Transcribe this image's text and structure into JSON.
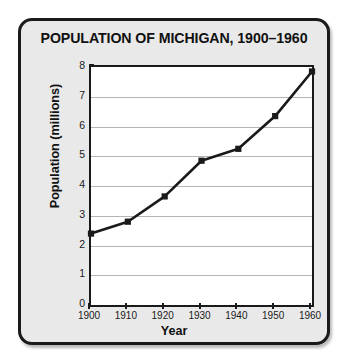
{
  "chart_data": {
    "type": "line",
    "title": "POPULATION OF MICHIGAN, 1900–1960",
    "xlabel": "Year",
    "ylabel": "Population (millions)",
    "x": [
      1900,
      1910,
      1920,
      1930,
      1940,
      1950,
      1960
    ],
    "values": [
      2.4,
      2.8,
      3.65,
      4.85,
      5.25,
      6.35,
      7.85
    ],
    "series": [
      {
        "name": "Population (millions)",
        "values": [
          2.4,
          2.8,
          3.65,
          4.85,
          5.25,
          6.35,
          7.85
        ]
      }
    ],
    "xtick_labels": [
      "1900",
      "1910",
      "1920",
      "1930",
      "1940",
      "1950",
      "1960"
    ],
    "ytick_labels": [
      "0",
      "1",
      "2",
      "3",
      "4",
      "5",
      "6",
      "7",
      "8"
    ],
    "ytick_values": [
      0,
      1,
      2,
      3,
      4,
      5,
      6,
      7,
      8
    ],
    "xlim": [
      1900,
      1960
    ],
    "ylim": [
      0,
      8
    ],
    "grid": "horizontal",
    "legend": "none",
    "marker": "square",
    "line_color": "#1a1a1a",
    "marker_color": "#1a1a1a",
    "grid_color": "#b4b4b4",
    "plot_background": "#ffffff",
    "card_background": "#e9e9e9",
    "border_color": "#1a1a1a"
  }
}
